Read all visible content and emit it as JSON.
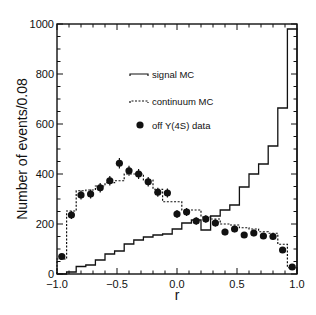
{
  "chart_data": {
    "type": "histogram",
    "title": "",
    "xlabel": "r",
    "ylabel": "Number of events/0.08",
    "xlim": [
      -1.0,
      1.0
    ],
    "ylim": [
      0,
      1000
    ],
    "bin_width": 0.08,
    "grid": false,
    "x_ticks": [
      "-1.0",
      "-0.5",
      "0.0",
      "0.5",
      "1.0"
    ],
    "y_ticks": [
      "0",
      "200",
      "400",
      "600",
      "800",
      "1000"
    ],
    "bin_centers": [
      -0.96,
      -0.88,
      -0.8,
      -0.72,
      -0.64,
      -0.56,
      -0.48,
      -0.4,
      -0.32,
      -0.24,
      -0.16,
      -0.08,
      0.0,
      0.08,
      0.16,
      0.24,
      0.32,
      0.4,
      0.48,
      0.56,
      0.64,
      0.72,
      0.8,
      0.88,
      0.96
    ],
    "legend_position": "upper center",
    "series": [
      {
        "name": "signal MC",
        "style": "solid-step",
        "values": [
          0,
          8,
          30,
          36,
          56,
          80,
          92,
          120,
          136,
          148,
          156,
          160,
          180,
          204,
          216,
          176,
          232,
          256,
          276,
          348,
          400,
          440,
          512,
          664,
          980
        ]
      },
      {
        "name": "continuum MC",
        "style": "dashed-step",
        "values": [
          60,
          252,
          333,
          336,
          352,
          365,
          373,
          400,
          400,
          376,
          339,
          289,
          289,
          256,
          256,
          228,
          220,
          200,
          196,
          185,
          180,
          169,
          163,
          119,
          25
        ]
      },
      {
        "name": "off Υ(4S) data",
        "style": "points-with-errors",
        "values": [
          70,
          236,
          316,
          320,
          345,
          373,
          443,
          413,
          400,
          369,
          327,
          324,
          240,
          248,
          212,
          220,
          204,
          168,
          180,
          156,
          164,
          152,
          150,
          96,
          28
        ],
        "errors": [
          10,
          16,
          18,
          18,
          19,
          19,
          21,
          20,
          20,
          19,
          18,
          18,
          16,
          16,
          15,
          15,
          14,
          13,
          13,
          12,
          13,
          12,
          12,
          10,
          6
        ]
      }
    ]
  },
  "legend": {
    "signal_label": "signal MC",
    "continuum_label": "continuum MC",
    "data_label": "off Υ(4S) data"
  },
  "axes": {
    "xlabel": "r",
    "ylabel": "Number of events/0.08"
  },
  "colors": {
    "line": "#111111",
    "background": "#ffffff"
  }
}
